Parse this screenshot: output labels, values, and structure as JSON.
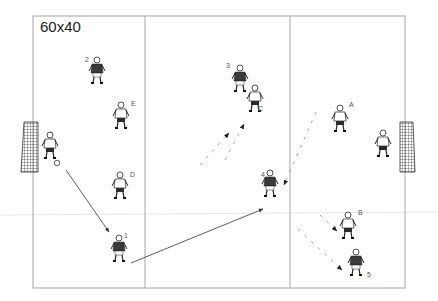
{
  "diagram": {
    "field_size_label": "60x40",
    "colors": {
      "field_line": "#b5b5b5",
      "midline": "#e6e6e6",
      "arrow": "#333333",
      "run_dash": "#888888",
      "team_dark_shirt": "#3a3a3a",
      "team_light_shirt": "#ffffff"
    },
    "zones": 3,
    "goals": [
      {
        "side": "left",
        "x": 20,
        "y": 122
      },
      {
        "side": "right",
        "x": 399,
        "y": 122
      }
    ],
    "goalkeepers": [
      {
        "side": "left",
        "x": 50,
        "y": 145
      },
      {
        "side": "right",
        "x": 383,
        "y": 143
      }
    ],
    "players": [
      {
        "label": "2",
        "team": "dark",
        "x": 97,
        "y": 70
      },
      {
        "label": "E",
        "team": "light",
        "x": 121,
        "y": 115
      },
      {
        "label": "D",
        "team": "light",
        "x": 120,
        "y": 185
      },
      {
        "label": "1",
        "team": "dark",
        "x": 119,
        "y": 248
      },
      {
        "label": "3",
        "team": "dark",
        "x": 240,
        "y": 78
      },
      {
        "label": "C",
        "team": "light",
        "x": 255,
        "y": 98
      },
      {
        "label": "4",
        "team": "dark",
        "x": 270,
        "y": 183
      },
      {
        "label": "A",
        "team": "light",
        "x": 340,
        "y": 118
      },
      {
        "label": "B",
        "team": "light",
        "x": 348,
        "y": 225
      },
      {
        "label": "5",
        "team": "dark",
        "x": 356,
        "y": 262
      }
    ],
    "passes": [
      {
        "from": "ball-left-gk",
        "to": "1"
      },
      {
        "from": "1",
        "to": "4"
      }
    ],
    "runs": [
      {
        "player": "3"
      },
      {
        "player": "C"
      },
      {
        "player": "4"
      },
      {
        "player": "B"
      },
      {
        "player": "5"
      }
    ]
  }
}
